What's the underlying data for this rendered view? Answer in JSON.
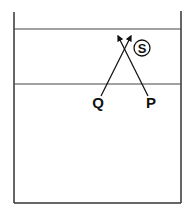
{
  "diagram": {
    "type": "court-play-diagram",
    "labels": {
      "player_q": "Q",
      "player_p": "P",
      "player_s": "S"
    },
    "colors": {
      "line": "#2a2a2a",
      "background": "#ffffff"
    }
  }
}
